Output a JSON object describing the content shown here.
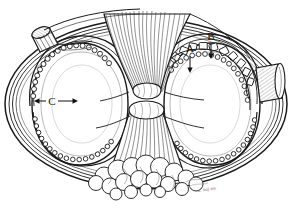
{
  "figure": {
    "kind": "anatomical-line-drawing",
    "background_color": "#ffffff",
    "ink_color": "#111111",
    "shading_color": "#555555",
    "width": 292,
    "height": 209
  },
  "labels": [
    {
      "id": "label-a",
      "text": "A",
      "x": 190,
      "y": 52,
      "leader": "arrow-down"
    },
    {
      "id": "label-b",
      "text": "B",
      "x": 211,
      "y": 40,
      "leader": "arrow-down"
    },
    {
      "id": "label-c",
      "text": "C",
      "x": 52,
      "y": 101,
      "leader": "arrow-both"
    }
  ],
  "annotations": {
    "signature": "a. naj ms"
  },
  "structures": [
    {
      "name": "medial-meniscus-left-lobe",
      "description": "Large oval crescent on the left half with scalloped inner rim"
    },
    {
      "name": "lateral-meniscus-right-lobe",
      "description": "Large oval crescent on the right half with scalloped inner rim"
    },
    {
      "name": "anterior-cruciate-ligament-fan",
      "description": "Fan-shaped striated ligament descending from the top center"
    },
    {
      "name": "posterior-cruciate-ligament-fan",
      "description": "Fan-shaped striated ligament rising from the bottom center"
    },
    {
      "name": "cut-ligament-stump-left",
      "description": "Cylindrical cut stump at the upper left margin"
    },
    {
      "name": "cut-ligament-stump-right",
      "description": "Cylindrical cut stump at the right margin"
    },
    {
      "name": "infrapatellar-fat-pad",
      "description": "Cloud-like lobulated fatty tissue along the lower center"
    },
    {
      "name": "joint-capsule-outline",
      "description": "Multi-line elliptical capsule border enclosing the whole plateau"
    }
  ]
}
